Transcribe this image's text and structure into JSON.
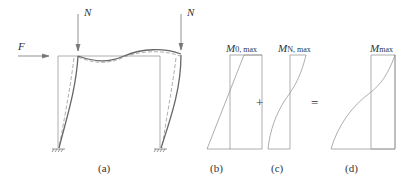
{
  "figure": {
    "panel_a": {
      "caption": "(a)",
      "load_left": "N",
      "load_right": "N",
      "horizontal_force": "F"
    },
    "panel_b": {
      "caption": "(b)",
      "moment_label": "M",
      "moment_sub": "0, max"
    },
    "panel_c": {
      "caption": "(c)",
      "moment_label": "M",
      "moment_sub": "N, max"
    },
    "panel_d": {
      "caption": "(d)",
      "moment_label": "M",
      "moment_sub": "max"
    },
    "operators": {
      "plus": "+",
      "equals": "="
    },
    "colors": {
      "line": "#8a8a8a",
      "deformed": "#6f6f6f",
      "text": "#333333"
    }
  }
}
